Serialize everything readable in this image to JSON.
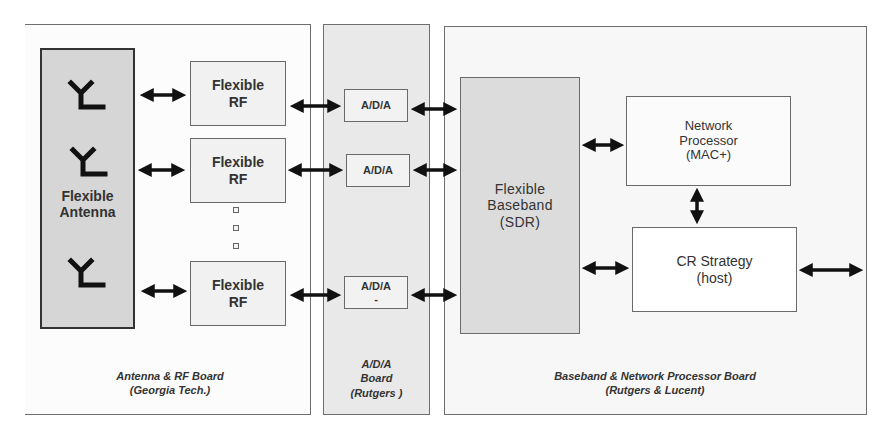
{
  "boards": {
    "antenna_rf": {
      "label": "Antenna & RF Board\n(Georgia Tech.)"
    },
    "ada": {
      "label": "A/D/A\nBoard\n(Rutgers )"
    },
    "baseband_np": {
      "label": "Baseband & Network Processor Board\n(Rutgers & Lucent)"
    }
  },
  "blocks": {
    "antenna": "Flexible\nAntenna",
    "rf": [
      "Flexible\nRF",
      "Flexible\nRF",
      "Flexible\nRF"
    ],
    "ada": [
      "A/D/A",
      "A/D/A",
      "A/D/A\n-"
    ],
    "baseband": "Flexible\nBaseband\n(SDR)",
    "network_processor": "Network\nProcessor\n(MAC+)",
    "cr_strategy": "CR Strategy\n(host)"
  },
  "icons": {
    "antenna_count": 3,
    "ellipsis_dots": 3
  },
  "colors": {
    "arrow": "#111111",
    "border": "#6e6e6e",
    "ada_board_fill": "#e9e9e9",
    "antenna_fill": "#d6d6d6",
    "baseband_fill": "#dcdcdc"
  }
}
